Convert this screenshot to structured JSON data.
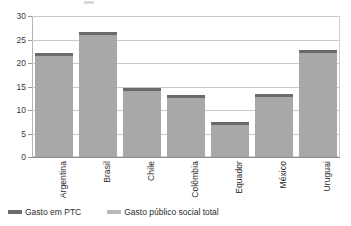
{
  "chart_data": {
    "type": "bar",
    "title": "",
    "xlabel": "",
    "ylabel": "",
    "categories": [
      "Argentina",
      "Brasil",
      "Chile",
      "Colômbia",
      "Equador",
      "México",
      "Uruguai"
    ],
    "series": [
      {
        "name": "Gasto público social total",
        "color": "#a8a8a8",
        "values": [
          22.2,
          26.5,
          14.6,
          13.2,
          7.5,
          13.5,
          22.8
        ]
      },
      {
        "name": "Gasto em PTC",
        "color": "#6b6b6b",
        "values": [
          0.4,
          0.5,
          0.3,
          0.3,
          0.4,
          0.3,
          0.4
        ]
      }
    ],
    "ylim": [
      0,
      30
    ],
    "yticks": [
      0,
      5,
      10,
      15,
      20,
      25,
      30
    ],
    "ytick_labels": [
      "0",
      "5",
      "10",
      "15",
      "20",
      "25",
      "30"
    ],
    "grid": true,
    "legend_position": "bottom"
  },
  "legend": {
    "items": [
      {
        "label": "Gasto em PTC",
        "swatch": "dark-swatch-icon"
      },
      {
        "label": "Gasto público social total",
        "swatch": "light-swatch-icon"
      }
    ]
  }
}
